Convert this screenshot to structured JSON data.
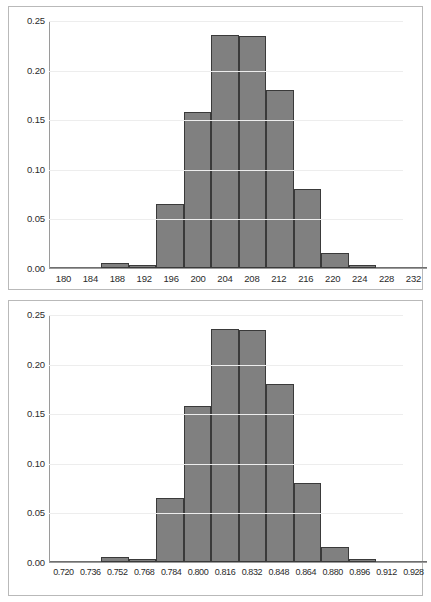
{
  "page": {
    "background": "#ffffff",
    "bar_fill": "#808080",
    "bar_stroke": "#3a3a3a",
    "grid_color": "#ededed",
    "axis_color": "#9a9a9a",
    "panel_border": "#b9b9b9"
  },
  "chart_data": [
    {
      "type": "bar",
      "title": "",
      "xlabel": "",
      "ylabel": "",
      "ylim": [
        0.0,
        0.25
      ],
      "yticks": [
        0.0,
        0.05,
        0.1,
        0.15,
        0.2,
        0.25
      ],
      "ytick_labels": [
        "0.00",
        "0.05",
        "0.10",
        "0.15",
        "0.20",
        "0.25"
      ],
      "grid": true,
      "legend": "none",
      "categories": [
        180,
        184,
        188,
        192,
        196,
        200,
        204,
        208,
        212,
        216,
        220,
        224,
        228,
        232
      ],
      "tick_labels": [
        "180",
        "184",
        "188",
        "192",
        "196",
        "200",
        "204",
        "208",
        "212",
        "216",
        "220",
        "224",
        "228",
        "232"
      ],
      "values": [
        0.0,
        0.0,
        0.005,
        0.003,
        0.065,
        0.157,
        0.235,
        0.234,
        0.179,
        0.08,
        0.015,
        0.003,
        0.001,
        0.0
      ]
    },
    {
      "type": "bar",
      "title": "",
      "xlabel": "",
      "ylabel": "",
      "ylim": [
        0.0,
        0.25
      ],
      "yticks": [
        0.0,
        0.05,
        0.1,
        0.15,
        0.2,
        0.25
      ],
      "ytick_labels": [
        "0.00",
        "0.05",
        "0.10",
        "0.15",
        "0.20",
        "0.25"
      ],
      "grid": true,
      "legend": "none",
      "categories": [
        0.72,
        0.736,
        0.752,
        0.768,
        0.784,
        0.8,
        0.816,
        0.832,
        0.848,
        0.864,
        0.88,
        0.896,
        0.912,
        0.928
      ],
      "tick_labels": [
        "0.720",
        "0.736",
        "0.752",
        "0.768",
        "0.784",
        "0.800",
        "0.816",
        "0.832",
        "0.848",
        "0.864",
        "0.880",
        "0.896",
        "0.912",
        "0.928"
      ],
      "values": [
        0.0,
        0.0,
        0.005,
        0.003,
        0.065,
        0.157,
        0.235,
        0.234,
        0.179,
        0.08,
        0.015,
        0.003,
        0.001,
        0.0
      ]
    }
  ]
}
